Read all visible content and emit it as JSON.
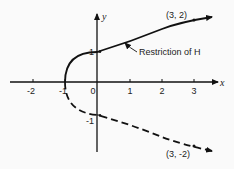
{
  "figure": {
    "x_axis_label": "x",
    "y_axis_label": "y",
    "x_ticks": [
      {
        "value": -2,
        "label": "-2"
      },
      {
        "value": -1,
        "label": "-1"
      },
      {
        "value": 0,
        "label": "0"
      },
      {
        "value": 1,
        "label": "1"
      },
      {
        "value": 2,
        "label": "2"
      },
      {
        "value": 3,
        "label": "3"
      }
    ],
    "y_ticks": [
      {
        "value": 1,
        "label": "1"
      },
      {
        "value": -1,
        "label": "-1"
      }
    ],
    "curve_equation": "x = y^2 - 1",
    "upper_branch": {
      "style": "solid",
      "label": "Restriction of H",
      "point_label": "(3, 2)"
    },
    "lower_branch": {
      "style": "dashed",
      "point_label": "(3, -2)"
    },
    "colors": {
      "stroke": "#111111",
      "background": "#fafafa"
    }
  }
}
